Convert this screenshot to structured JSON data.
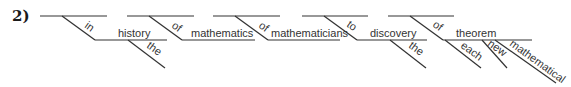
{
  "problem_number": "2)",
  "words": {
    "in": "in",
    "history": "history",
    "the1": "the",
    "of1": "of",
    "mathematics": "mathematics",
    "of2": "of",
    "mathematicians": "mathematicians",
    "to": "to",
    "discovery": "discovery",
    "the2": "the",
    "of3": "of",
    "theorem": "theorem",
    "each": "each",
    "new": "new",
    "mathematical": "mathematical"
  },
  "colors": {
    "line": "#333333",
    "text": "#333333",
    "background": "#ffffff"
  }
}
